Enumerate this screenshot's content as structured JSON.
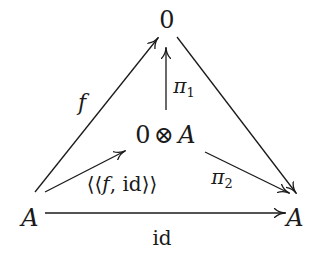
{
  "diagram": {
    "type": "commutative-diagram",
    "nodes": {
      "top": {
        "text": "0",
        "x": 167,
        "y": 20
      },
      "center_left": {
        "text": "0",
        "x": 143,
        "y": 135
      },
      "center_op": {
        "text": "⊗",
        "x": 164,
        "y": 135
      },
      "center_right": {
        "text": "A",
        "x": 187,
        "y": 135
      },
      "left": {
        "text": "A",
        "x": 30,
        "y": 218
      },
      "right": {
        "text": "A",
        "x": 295,
        "y": 218
      }
    },
    "labels": {
      "f": {
        "text": "f",
        "x": 82,
        "y": 103
      },
      "pi1_base": {
        "text": "π",
        "sub": "1",
        "x": 184,
        "y": 87
      },
      "pairing": {
        "text": "⟨⟨f, id⟩⟩",
        "pre": "⟨⟨",
        "fn": "f",
        "mid": ", id",
        "post": "⟩⟩",
        "x": 122,
        "y": 184
      },
      "pi2_base": {
        "text": "π",
        "sub": "2",
        "x": 222,
        "y": 178
      },
      "id": {
        "text": "id",
        "x": 162,
        "y": 238
      }
    },
    "arrows": [
      {
        "name": "f",
        "from": "A (left)",
        "to": "0 (top)"
      },
      {
        "name": "π1",
        "from": "0 ⊗ A",
        "to": "0 (top)"
      },
      {
        "name": "⟨⟨f, id⟩⟩",
        "from": "A (left)",
        "to": "0 ⊗ A"
      },
      {
        "name": "π2",
        "from": "0 ⊗ A",
        "to": "A (right)"
      },
      {
        "name": "unlabeled",
        "from": "0 (top)",
        "to": "A (right)"
      },
      {
        "name": "id",
        "from": "A (left)",
        "to": "A (right)"
      }
    ],
    "stroke_color": "#1a1a1a",
    "background": "#ffffff"
  }
}
